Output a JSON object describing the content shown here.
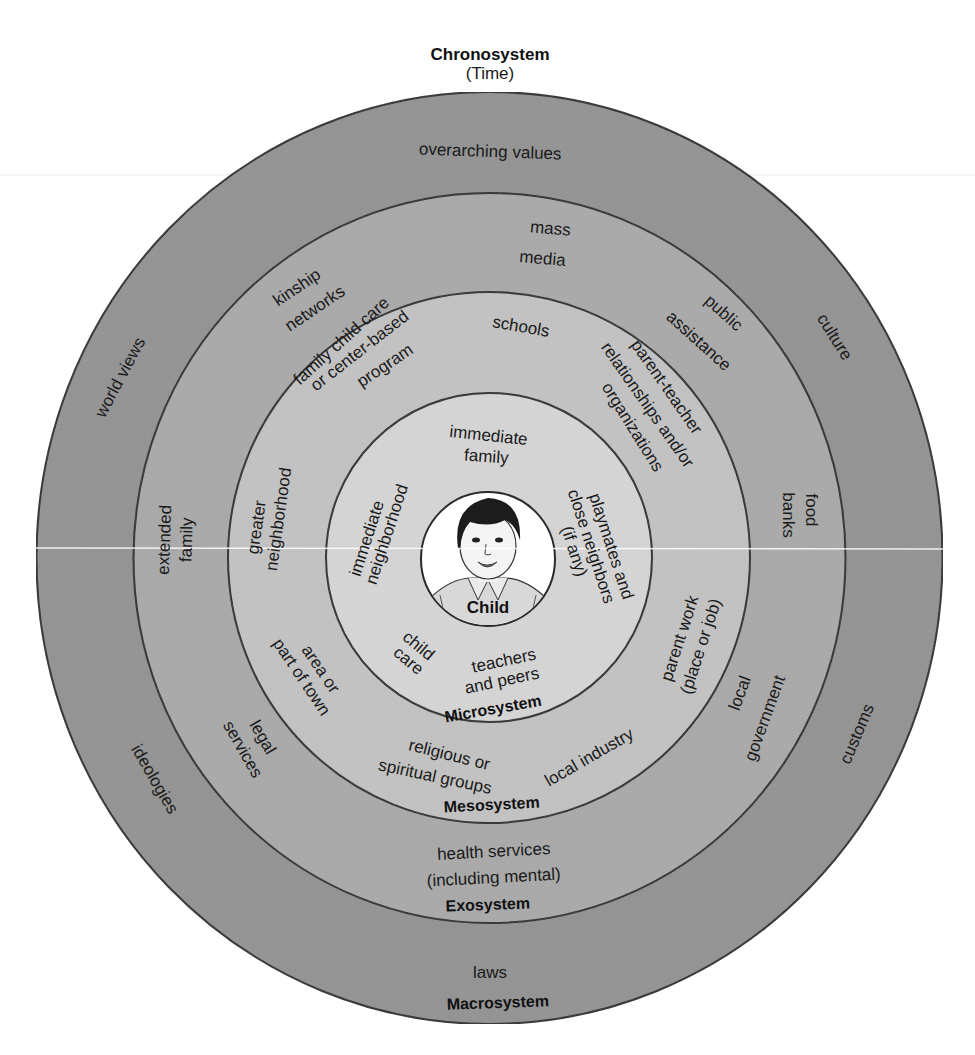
{
  "title": {
    "label": "Chronosystem",
    "sublabel": "(Time)"
  },
  "colors": {
    "macro": "#939393",
    "exo": "#a9a9a9",
    "meso": "#c2c2c2",
    "micro": "#d5d5d5",
    "child": "#ffffff",
    "stroke": "#2a2a2a"
  },
  "rings": {
    "macrosystem": {
      "name": "Macrosystem",
      "items": [
        "overarching values",
        "world views",
        "culture",
        "customs",
        "ideologies",
        "laws"
      ]
    },
    "exosystem": {
      "name": "Exosystem",
      "items": [
        "mass media",
        "kinship networks",
        "public assistance",
        "extended family",
        "food banks",
        "legal services",
        "local government",
        "health services (including mental)"
      ]
    },
    "mesosystem": {
      "name": "Mesosystem",
      "items": [
        "schools",
        "family child care or center-based program",
        "parent-teacher relationships and/or organizations",
        "greater neighborhood",
        "parent work (place or job)",
        "area or part of town",
        "religious or spiritual groups",
        "local industry"
      ]
    },
    "microsystem": {
      "name": "Microsystem",
      "items": [
        "immediate family",
        "immediate neighborhood",
        "playmates and close neighbors (if any)",
        "child care",
        "teachers and peers"
      ]
    },
    "center": {
      "name": "Child"
    }
  },
  "labels": {
    "overarching_values": "overarching values",
    "world_views": "world views",
    "culture": "culture",
    "customs": "customs",
    "ideologies": "ideologies",
    "laws": "laws",
    "mass": "mass",
    "media": "media",
    "kinship": "kinship",
    "networks": "networks",
    "public": "public",
    "assistance": "assistance",
    "extended": "extended",
    "family": "family",
    "food": "food",
    "banks": "banks",
    "legal": "legal",
    "services": "services",
    "local": "local",
    "government": "government",
    "health_services": "health services",
    "including_mental": "(including mental)",
    "schools": "schools",
    "fcc1": "family child care",
    "fcc2": "or center-based",
    "fcc3": "program",
    "pt1": "parent-teacher",
    "pt2": "relationships and/or",
    "pt3": "organizations",
    "greater": "greater",
    "neighborhood": "neighborhood",
    "parent_work": "parent work",
    "place_or_job": "(place or job)",
    "area_or": "area or",
    "part_of_town": "part of town",
    "religious_or": "religious or",
    "spiritual_groups": "spiritual groups",
    "local_industry": "local industry",
    "immediate": "immediate",
    "imm_family": "family",
    "imm_neigh1": "immediate",
    "imm_neigh2": "neighborhood",
    "play1": "playmates and",
    "play2": "close neighbors",
    "play3": "(if any)",
    "child": "child",
    "care": "care",
    "teachers": "teachers",
    "and_peers": "and peers"
  }
}
